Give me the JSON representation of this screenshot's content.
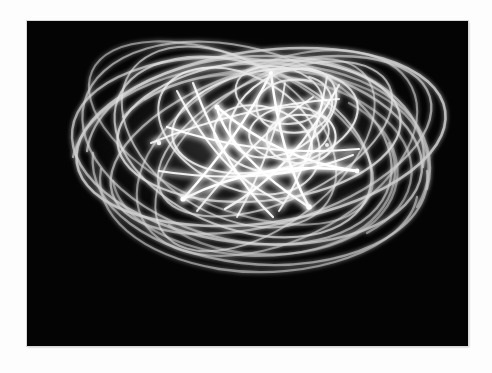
{
  "page": {
    "background_color": "#fdfdfd",
    "width": 492,
    "height": 373
  },
  "photograph": {
    "kind": "light-painting-photograph",
    "border_color": "#d8d8d8",
    "background_color": "#050505",
    "trace_color": "#ffffff",
    "dim_trace_color": "#9a9a9a",
    "bounds": {
      "x": 27,
      "y": 21,
      "width": 441,
      "height": 325
    },
    "subject_description": "Harmonograph pendulum light trace forming a five-pointed star surrounded by nested elliptical loops",
    "alt_text": "White glowing curved light trails swirling in overlapping ellipses with a bright star-like knot at the centre, photographed against a black background"
  },
  "chart_data": {
    "type": "line",
    "xlabel": "",
    "ylabel": "",
    "xlim": [
      0,
      441
    ],
    "ylim": [
      0,
      325
    ],
    "grid": false,
    "legend": "none",
    "center": {
      "x": 222,
      "y": 120
    },
    "series": [
      {
        "name": "outer-ellipse-1",
        "cx": 232,
        "cy": 118,
        "rx": 186,
        "ry": 86,
        "rotate": -8,
        "opacity": 0.8,
        "width": 2.6
      },
      {
        "name": "outer-ellipse-2",
        "cx": 222,
        "cy": 130,
        "rx": 178,
        "ry": 92,
        "rotate": 6,
        "opacity": 0.72,
        "width": 2.4
      },
      {
        "name": "outer-ellipse-3",
        "cx": 240,
        "cy": 126,
        "rx": 168,
        "ry": 80,
        "rotate": -16,
        "opacity": 0.68,
        "width": 2.3
      },
      {
        "name": "outer-ellipse-4",
        "cx": 214,
        "cy": 122,
        "rx": 160,
        "ry": 96,
        "rotate": 14,
        "opacity": 0.66,
        "width": 2.2
      },
      {
        "name": "mid-ellipse-1",
        "cx": 230,
        "cy": 112,
        "rx": 142,
        "ry": 72,
        "rotate": -4,
        "opacity": 0.74,
        "width": 2.2
      },
      {
        "name": "mid-ellipse-2",
        "cx": 218,
        "cy": 128,
        "rx": 136,
        "ry": 82,
        "rotate": 20,
        "opacity": 0.62,
        "width": 2.1
      },
      {
        "name": "mid-ellipse-3",
        "cx": 246,
        "cy": 120,
        "rx": 128,
        "ry": 64,
        "rotate": -24,
        "opacity": 0.6,
        "width": 2.0
      },
      {
        "name": "mid-ellipse-4",
        "cx": 206,
        "cy": 118,
        "rx": 120,
        "ry": 78,
        "rotate": 32,
        "opacity": 0.58,
        "width": 2.0
      },
      {
        "name": "inner-ellipse-1",
        "cx": 236,
        "cy": 104,
        "rx": 96,
        "ry": 52,
        "rotate": -10,
        "opacity": 0.78,
        "width": 2.0
      },
      {
        "name": "inner-ellipse-2",
        "cx": 214,
        "cy": 112,
        "rx": 88,
        "ry": 58,
        "rotate": 26,
        "opacity": 0.7,
        "width": 1.9
      },
      {
        "name": "inner-ellipse-3",
        "cx": 248,
        "cy": 96,
        "rx": 62,
        "ry": 40,
        "rotate": -30,
        "opacity": 0.82,
        "width": 2.0
      },
      {
        "name": "inner-ellipse-4",
        "cx": 230,
        "cy": 116,
        "rx": 54,
        "ry": 34,
        "rotate": 18,
        "opacity": 0.8,
        "width": 1.9
      },
      {
        "name": "star-knot",
        "points": 5,
        "cx": 218,
        "cy": 114,
        "r_outer": 78,
        "r_inner": 30,
        "rotate": -14,
        "opacity": 1.0,
        "width": 2.4
      }
    ]
  }
}
